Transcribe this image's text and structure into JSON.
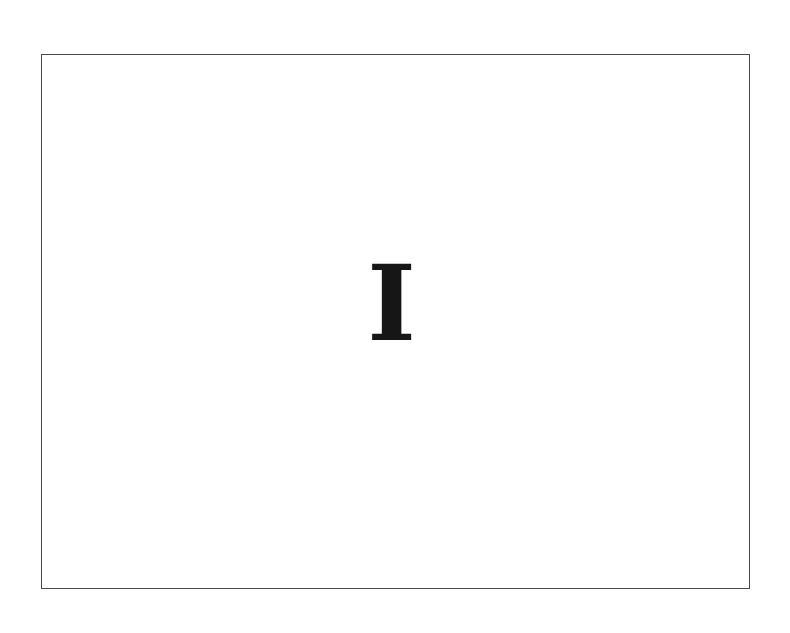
{
  "slide": {
    "glyph": "I",
    "border_color": "#4a4a4a",
    "glyph_color": "#161616",
    "background": "#ffffff"
  }
}
